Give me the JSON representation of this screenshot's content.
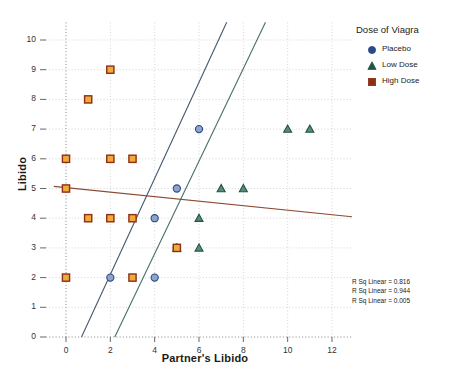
{
  "chart_data": {
    "type": "scatter",
    "title": "",
    "xlabel": "Partner's Libido",
    "ylabel": "Libido",
    "xlim": [
      -0.9,
      12.9
    ],
    "ylim": [
      0,
      10.6
    ],
    "xticks": [
      0,
      2,
      4,
      6,
      8,
      10,
      12
    ],
    "yticks": [
      0,
      1,
      2,
      3,
      4,
      5,
      6,
      7,
      8,
      9,
      10
    ],
    "grid": true,
    "legend_position": "right-top",
    "legend_title": "Dose of Viagra",
    "series": [
      {
        "name": "Placebo",
        "marker": "circle",
        "color": "#2c4a86",
        "fill": "#8ea4c8",
        "line_color": "#46586d",
        "r_sq_linear": 0.816,
        "points": [
          {
            "x": 2,
            "y": 2
          },
          {
            "x": 4,
            "y": 2
          },
          {
            "x": 4,
            "y": 4
          },
          {
            "x": 5,
            "y": 3
          },
          {
            "x": 5,
            "y": 5
          },
          {
            "x": 6,
            "y": 7
          }
        ],
        "fit_line": {
          "x1": 0.7,
          "y1": 0,
          "x2": 7.25,
          "y2": 10.6
        }
      },
      {
        "name": "Low Dose",
        "marker": "triangle",
        "color": "#1f5544",
        "fill": "#5b8a78",
        "line_color": "#46706a",
        "r_sq_linear": 0.944,
        "points": [
          {
            "x": 5,
            "y": 3
          },
          {
            "x": 6,
            "y": 3
          },
          {
            "x": 6,
            "y": 4
          },
          {
            "x": 7,
            "y": 5
          },
          {
            "x": 8,
            "y": 5
          },
          {
            "x": 10,
            "y": 7
          },
          {
            "x": 11,
            "y": 7
          }
        ],
        "fit_line": {
          "x1": 2.2,
          "y1": 0,
          "x2": 9.0,
          "y2": 10.6
        }
      },
      {
        "name": "High Dose",
        "marker": "square",
        "color": "#8c2f14",
        "fill": "#eeab3c",
        "line_color": "#8b4a33",
        "r_sq_linear": 0.005,
        "points": [
          {
            "x": 0,
            "y": 2
          },
          {
            "x": 0,
            "y": 5
          },
          {
            "x": 0,
            "y": 6
          },
          {
            "x": 1,
            "y": 4
          },
          {
            "x": 1,
            "y": 8
          },
          {
            "x": 2,
            "y": 4
          },
          {
            "x": 2,
            "y": 6
          },
          {
            "x": 2,
            "y": 9
          },
          {
            "x": 3,
            "y": 2
          },
          {
            "x": 3,
            "y": 4
          },
          {
            "x": 3,
            "y": 6
          },
          {
            "x": 5,
            "y": 3
          }
        ],
        "fit_line": {
          "x1": -0.55,
          "y1": 5.07,
          "x2": 12.9,
          "y2": 4.05
        }
      }
    ],
    "annotations": [
      "R Sq Linear = 0.816",
      "R Sq Linear = 0.944",
      "R Sq Linear = 0.005"
    ]
  },
  "axes": {
    "y_title": "Libido",
    "x_title": "Partner's Libido",
    "y_tick_labels": [
      "0",
      "1",
      "2",
      "3",
      "4",
      "5",
      "6",
      "7",
      "8",
      "9",
      "10"
    ],
    "x_tick_labels": [
      "0",
      "2",
      "4",
      "6",
      "8",
      "10",
      "12"
    ]
  },
  "legend": {
    "title": "Dose of Viagra",
    "items": [
      {
        "label": "Placebo",
        "icon": "circle-marker-icon"
      },
      {
        "label": "Low Dose",
        "icon": "triangle-marker-icon"
      },
      {
        "label": "High Dose",
        "icon": "square-marker-icon"
      }
    ]
  },
  "colors": {
    "placebo": "#2c4a86",
    "low_dose": "#1f5544",
    "high_dose": "#8c2f14",
    "high_dose_fill": "#eeab3c",
    "grid": "#cccccc"
  }
}
